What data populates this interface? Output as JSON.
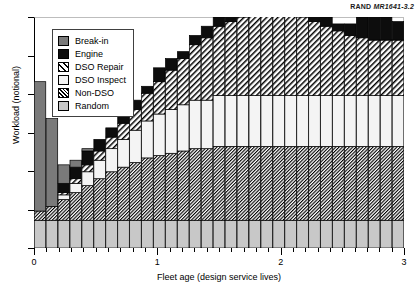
{
  "credit": {
    "org": "RAND",
    "figure": "MR1641-3.2"
  },
  "axes": {
    "ylabel": "Workload (notional)",
    "xlabel": "Fleet age (design service lives)",
    "xticklabels": [
      "0",
      "1",
      "2",
      "3"
    ],
    "xtickvalues": [
      0,
      1,
      2,
      3
    ],
    "yticklabels": [],
    "grid": false
  },
  "legend": {
    "position": "upper-left-inside",
    "items": [
      {
        "label": "Break-in",
        "pattern": "solid-dark-gray",
        "color": "#7a7a7a"
      },
      {
        "label": "Engine",
        "pattern": "solid-black",
        "color": "#0d0d0d"
      },
      {
        "label": "DSO Repair",
        "pattern": "diagonal-hatch",
        "color": "#ffffff"
      },
      {
        "label": "DSO Inspect",
        "pattern": "solid-white",
        "color": "#f4f4f4"
      },
      {
        "label": "Non-DSO",
        "pattern": "dense-diagonal-hatch",
        "color": "#ffffff"
      },
      {
        "label": "Random",
        "pattern": "solid-light-gray",
        "color": "#c8c8c8"
      }
    ]
  },
  "chart_data": {
    "type": "bar",
    "stacked": true,
    "title": "",
    "xlabel": "Fleet age (design service lives)",
    "ylabel": "Workload (notional)",
    "xlim": [
      -0.08,
      3.08
    ],
    "ylim": [
      0,
      100
    ],
    "bar_count": 31,
    "x": [
      0.0,
      0.1,
      0.2,
      0.3,
      0.4,
      0.5,
      0.6,
      0.7,
      0.8,
      0.9,
      1.0,
      1.1,
      1.2,
      1.3,
      1.4,
      1.5,
      1.6,
      1.7,
      1.8,
      1.9,
      2.0,
      2.1,
      2.2,
      2.3,
      2.4,
      2.5,
      2.6,
      2.7,
      2.8,
      2.9,
      3.0
    ],
    "series": [
      {
        "name": "Random",
        "order": 1,
        "values": [
          12,
          12,
          12,
          12,
          12,
          12,
          12,
          12,
          12,
          12,
          12,
          12,
          12,
          12,
          12,
          12,
          12,
          12,
          12,
          12,
          12,
          12,
          12,
          12,
          12,
          12,
          12,
          12,
          12,
          12,
          12
        ]
      },
      {
        "name": "Non-DSO",
        "order": 2,
        "values": [
          4,
          6,
          9,
          12,
          15,
          18,
          21,
          23,
          25,
          27,
          28,
          29,
          30,
          31,
          31,
          32,
          32,
          32,
          32,
          32,
          32,
          32,
          32,
          32,
          32,
          32,
          32,
          32,
          32,
          32,
          32
        ]
      },
      {
        "name": "DSO Inspect",
        "order": 3,
        "values": [
          0,
          0,
          2,
          4,
          6,
          8,
          10,
          12,
          14,
          16,
          18,
          19,
          20,
          21,
          21,
          22,
          22,
          22,
          22,
          22,
          22,
          22,
          22,
          22,
          22,
          22,
          22,
          22,
          22,
          22,
          22
        ]
      },
      {
        "name": "DSO Repair",
        "order": 4,
        "values": [
          0,
          0,
          1,
          2,
          3,
          4,
          5,
          7,
          9,
          12,
          14,
          17,
          20,
          24,
          27,
          30,
          32,
          34,
          35,
          36,
          36,
          35,
          34,
          32,
          30,
          28,
          26,
          25,
          24,
          24,
          24
        ]
      },
      {
        "name": "Engine",
        "order": 5,
        "values": [
          0,
          0,
          4,
          5,
          6,
          5,
          4,
          5,
          4,
          3,
          6,
          5,
          3,
          4,
          5,
          4,
          6,
          8,
          10,
          12,
          13,
          11,
          8,
          6,
          4,
          3,
          5,
          9,
          12,
          10,
          8
        ]
      },
      {
        "name": "Break-in",
        "order": 6,
        "values": [
          56,
          38,
          8,
          3,
          1,
          0,
          0,
          0,
          0,
          0,
          0,
          0,
          0,
          0,
          0,
          0,
          0,
          0,
          0,
          0,
          0,
          0,
          0,
          0,
          0,
          0,
          0,
          0,
          0,
          0,
          0
        ]
      }
    ]
  }
}
